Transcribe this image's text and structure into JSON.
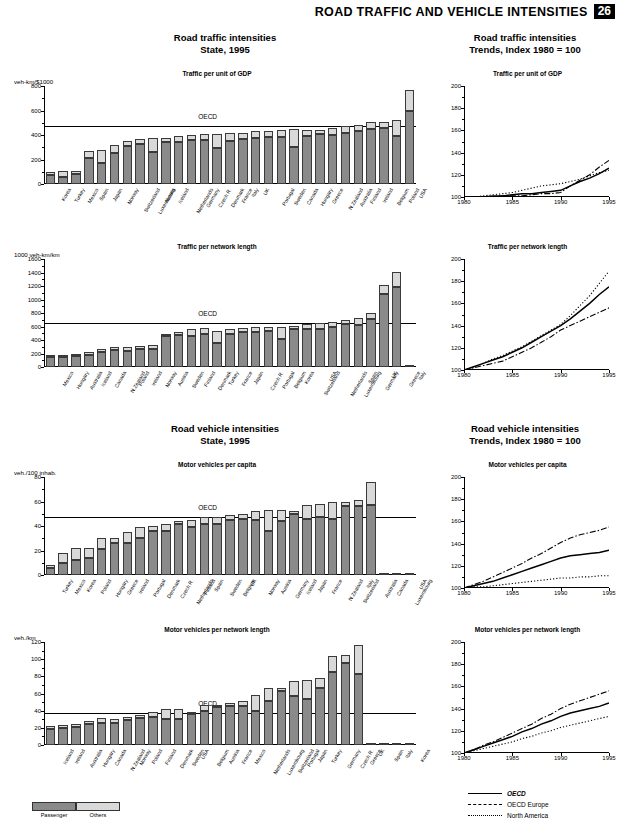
{
  "header": {
    "title": "ROAD TRAFFIC AND VEHICLE INTENSITIES",
    "page_number": "26"
  },
  "sections": {
    "traffic_state": {
      "title_line1": "Road traffic intensities",
      "title_line2": "State, 1995"
    },
    "traffic_trends": {
      "title_line1": "Road traffic intensities",
      "title_line2": "Trends, Index 1980 = 100"
    },
    "vehicle_state": {
      "title_line1": "Road vehicle intensities",
      "title_line2": "State, 1995"
    },
    "vehicle_trends": {
      "title_line1": "Road vehicle intensities",
      "title_line2": "Trends, Index 1980 = 100"
    }
  },
  "legend": {
    "passenger": "Passenger",
    "others": "Others"
  },
  "trend_legend": {
    "oecd": "OECD",
    "oecd_europe": "OECD Europe",
    "north_america": "North America"
  },
  "oecd_label": "OECD",
  "chart_data": [
    {
      "id": "traffic-per-gdp-bars",
      "type": "bar",
      "title": "Traffic per unit of GDP",
      "ylabel": "veh-km/$1000",
      "ylim": [
        0,
        800
      ],
      "yticks": [
        0,
        200,
        400,
        600,
        800
      ],
      "reference_line": {
        "label": "OECD",
        "value": 475
      },
      "stacked": true,
      "series": [
        {
          "name": "Passenger",
          "values": [
            75,
            60,
            85,
            215,
            170,
            255,
            310,
            325,
            265,
            340,
            345,
            360,
            360,
            290,
            350,
            365,
            375,
            380,
            385,
            300,
            395,
            410,
            400,
            415,
            430,
            450,
            460,
            390,
            600
          ]
        },
        {
          "name": "Others",
          "values": [
            20,
            45,
            20,
            55,
            110,
            60,
            45,
            45,
            110,
            35,
            50,
            40,
            45,
            115,
            70,
            55,
            55,
            50,
            55,
            150,
            45,
            35,
            55,
            60,
            55,
            55,
            50,
            130,
            170
          ]
        }
      ],
      "categories": [
        "Korea",
        "Turkey",
        "Mexico",
        "Spain",
        "Japan",
        "Norway",
        "Switzerland",
        "Luxembourg",
        "Austria",
        "Iceland",
        "Netherlands",
        "Germany",
        "Czech R.",
        "Denmark",
        "France",
        "Italy",
        "UK",
        "Portugal",
        "Sweden",
        "Canada",
        "Hungary",
        "Greece",
        "N.Zealand",
        "Australia",
        "Finland",
        "Ireland",
        "Belgium",
        "Poland",
        "USA"
      ]
    },
    {
      "id": "traffic-per-gdp-trends",
      "type": "line",
      "title": "Traffic per unit of GDP",
      "ylim": [
        100,
        200
      ],
      "yticks": [
        100,
        120,
        140,
        160,
        180,
        200
      ],
      "xlim": [
        1980,
        1995
      ],
      "xticks": [
        1980,
        1985,
        1990,
        1995
      ],
      "x": [
        1980,
        1981,
        1982,
        1983,
        1984,
        1985,
        1986,
        1987,
        1988,
        1989,
        1990,
        1991,
        1992,
        1993,
        1994,
        1995
      ],
      "series": [
        {
          "name": "OECD",
          "style": "solid",
          "values": [
            100,
            100,
            100,
            101,
            101,
            102,
            103,
            103,
            104,
            105,
            106,
            110,
            114,
            117,
            121,
            126
          ]
        },
        {
          "name": "OECD Europe",
          "style": "dash-dot",
          "values": [
            100,
            100,
            99,
            100,
            101,
            101,
            101,
            102,
            103,
            103,
            104,
            110,
            115,
            120,
            127,
            133
          ]
        },
        {
          "name": "North America",
          "style": "dotted",
          "values": [
            100,
            100,
            101,
            102,
            103,
            104,
            106,
            108,
            110,
            111,
            112,
            114,
            116,
            119,
            122,
            124
          ]
        }
      ]
    },
    {
      "id": "traffic-per-network-bars",
      "type": "bar",
      "title": "Traffic per network length",
      "ylabel": "1000 veh-km/km",
      "ylim": [
        0,
        1600
      ],
      "yticks": [
        0,
        200,
        400,
        600,
        800,
        1000,
        1200,
        1400,
        1600
      ],
      "reference_line": {
        "label": "OECD",
        "value": 650
      },
      "stacked": true,
      "series": [
        {
          "name": "Passenger",
          "values": [
            150,
            155,
            160,
            185,
            225,
            245,
            230,
            260,
            265,
            465,
            480,
            465,
            490,
            350,
            490,
            520,
            520,
            540,
            420,
            560,
            560,
            570,
            590,
            640,
            620,
            710,
            1080,
            1190
          ]
        },
        {
          "name": "Others",
          "values": [
            25,
            25,
            30,
            35,
            45,
            50,
            65,
            55,
            60,
            25,
            35,
            95,
            85,
            190,
            70,
            60,
            75,
            60,
            180,
            55,
            70,
            80,
            80,
            60,
            110,
            90,
            130,
            215
          ]
        }
      ],
      "categories": [
        "Mexico",
        "Hungary",
        "Australia",
        "Iceland",
        "Canada",
        "N.Zealand",
        "Poland",
        "Ireland",
        "Norway",
        "Austria",
        "Sweden",
        "Finland",
        "Denmark",
        "Turkey",
        "France",
        "Japan",
        "Czech R.",
        "Portugal",
        "Belgium",
        "Korea",
        "Switzerland",
        "USA",
        "Netherlands",
        "Luxembourg",
        "Spain",
        "Germany",
        "UK",
        "Greece",
        "Italy"
      ]
    },
    {
      "id": "traffic-per-network-trends",
      "type": "line",
      "title": "Traffic per network length",
      "ylim": [
        100,
        200
      ],
      "yticks": [
        100,
        120,
        140,
        160,
        180,
        200
      ],
      "xlim": [
        1980,
        1995
      ],
      "xticks": [
        1980,
        1985,
        1990,
        1995
      ],
      "x": [
        1980,
        1981,
        1982,
        1983,
        1984,
        1985,
        1986,
        1987,
        1988,
        1989,
        1990,
        1991,
        1992,
        1993,
        1994,
        1995
      ],
      "series": [
        {
          "name": "OECD",
          "style": "solid",
          "values": [
            100,
            103,
            106,
            109,
            112,
            116,
            120,
            125,
            130,
            135,
            140,
            146,
            153,
            160,
            168,
            175
          ]
        },
        {
          "name": "OECD Europe",
          "style": "dash-dot",
          "values": [
            100,
            102,
            104,
            106,
            108,
            112,
            116,
            120,
            125,
            130,
            136,
            140,
            144,
            148,
            152,
            156
          ]
        },
        {
          "name": "North America",
          "style": "dotted",
          "values": [
            100,
            103,
            106,
            110,
            113,
            117,
            121,
            126,
            131,
            136,
            141,
            149,
            158,
            167,
            178,
            189
          ]
        }
      ]
    },
    {
      "id": "vehicles-per-capita-bars",
      "type": "bar",
      "title": "Motor vehicles per capita",
      "ylabel": "veh./100 inhab.",
      "ylim": [
        0,
        80
      ],
      "yticks": [
        0,
        20,
        40,
        60,
        80
      ],
      "reference_line": {
        "label": "OECD",
        "value": 47
      },
      "stacked": true,
      "series": [
        {
          "name": "Passenger",
          "values": [
            6,
            10,
            12,
            14,
            21,
            26,
            26,
            30,
            36,
            36,
            42,
            39,
            42,
            42,
            45,
            46,
            45,
            36,
            44,
            50,
            46,
            47,
            46,
            56,
            56,
            57
          ]
        },
        {
          "name": "Others",
          "values": [
            2.5,
            8,
            10,
            8,
            9,
            4,
            9,
            9,
            4,
            6,
            2.5,
            6,
            5,
            5,
            4,
            4,
            7,
            17,
            9,
            2,
            11,
            11,
            14,
            4,
            5,
            19
          ]
        }
      ],
      "categories": [
        "Turkey",
        "Mexico",
        "Korea",
        "Poland",
        "Hungary",
        "Greece",
        "Ireland",
        "Portugal",
        "Denmark",
        "Czech R.",
        "Netherlands",
        "Finland",
        "Spain",
        "Sweden",
        "Belgium",
        "UK",
        "Norway",
        "Austria",
        "Germany",
        "Iceland",
        "Japan",
        "France",
        "N.Zealand",
        "Switzerland",
        "Italy",
        "Australia",
        "Canada",
        "Luxembourg",
        "USA"
      ]
    },
    {
      "id": "vehicles-per-capita-trends",
      "type": "line",
      "title": "Motor vehicles per capita",
      "ylim": [
        100,
        200
      ],
      "yticks": [
        100,
        120,
        140,
        160,
        180,
        200
      ],
      "xlim": [
        1980,
        1995
      ],
      "xticks": [
        1980,
        1985,
        1990,
        1995
      ],
      "x": [
        1980,
        1981,
        1982,
        1983,
        1984,
        1985,
        1986,
        1987,
        1988,
        1989,
        1990,
        1991,
        1992,
        1993,
        1994,
        1995
      ],
      "series": [
        {
          "name": "OECD",
          "style": "solid",
          "values": [
            100,
            102,
            104,
            106,
            109,
            112,
            115,
            118,
            121,
            124,
            127,
            129,
            130,
            131,
            132,
            134
          ]
        },
        {
          "name": "OECD Europe",
          "style": "dash-dot",
          "values": [
            100,
            103,
            106,
            110,
            114,
            118,
            122,
            127,
            131,
            136,
            141,
            145,
            148,
            150,
            152,
            155
          ]
        },
        {
          "name": "North America",
          "style": "dotted",
          "values": [
            100,
            101,
            101,
            102,
            103,
            104,
            105,
            106,
            107,
            108,
            109,
            109,
            110,
            110,
            111,
            111
          ]
        }
      ]
    },
    {
      "id": "vehicles-per-network-bars",
      "type": "bar",
      "title": "Motor vehicles per network length",
      "ylabel": "veh./km",
      "ylim": [
        0,
        120
      ],
      "yticks": [
        0,
        20,
        40,
        60,
        80,
        100,
        120
      ],
      "reference_line": {
        "label": "OECD",
        "value": 37
      },
      "stacked": true,
      "series": [
        {
          "name": "Passenger",
          "values": [
            19,
            20,
            21,
            25,
            26,
            26,
            29,
            32,
            33,
            30,
            30,
            36,
            40,
            44,
            45,
            46,
            40,
            51,
            63,
            57,
            54,
            67,
            85,
            96,
            83
          ]
        },
        {
          "name": "Others",
          "values": [
            3,
            3.5,
            3,
            3,
            5,
            4,
            4,
            3.5,
            5,
            12,
            12,
            2,
            7,
            3,
            4,
            5,
            18,
            16,
            4,
            18,
            22,
            11,
            19,
            9,
            33
          ]
        }
      ],
      "categories": [
        "Iceland",
        "Ireland",
        "Australia",
        "Hungary",
        "Canada",
        "N.Zealand",
        "Norway",
        "Poland",
        "Finland",
        "Denmark",
        "Sweden",
        "USA",
        "Belgium",
        "Austria",
        "France",
        "Mexico",
        "Netherlands",
        "Luxembourg",
        "Switzerland",
        "Portugal",
        "Japan",
        "Turkey",
        "Germany",
        "Czech R.",
        "Greece",
        "UK",
        "Spain",
        "Italy",
        "Korea"
      ]
    },
    {
      "id": "vehicles-per-network-trends",
      "type": "line",
      "title": "Motor vehicles per network length",
      "ylim": [
        100,
        200
      ],
      "yticks": [
        100,
        120,
        140,
        160,
        180,
        200
      ],
      "xlim": [
        1980,
        1995
      ],
      "xticks": [
        1980,
        1985,
        1990,
        1995
      ],
      "x": [
        1980,
        1981,
        1982,
        1983,
        1984,
        1985,
        1986,
        1987,
        1988,
        1989,
        1990,
        1991,
        1992,
        1993,
        1994,
        1995
      ],
      "series": [
        {
          "name": "OECD",
          "style": "solid",
          "values": [
            100,
            103,
            106,
            109,
            112,
            115,
            119,
            122,
            126,
            129,
            133,
            136,
            138,
            140,
            142,
            145
          ]
        },
        {
          "name": "OECD Europe",
          "style": "dash-dot",
          "values": [
            100,
            103,
            107,
            110,
            114,
            118,
            122,
            126,
            131,
            135,
            140,
            144,
            147,
            150,
            153,
            156
          ]
        },
        {
          "name": "North America",
          "style": "dotted",
          "values": [
            100,
            102,
            104,
            106,
            108,
            110,
            113,
            115,
            118,
            120,
            123,
            125,
            127,
            129,
            131,
            133
          ]
        }
      ]
    }
  ]
}
